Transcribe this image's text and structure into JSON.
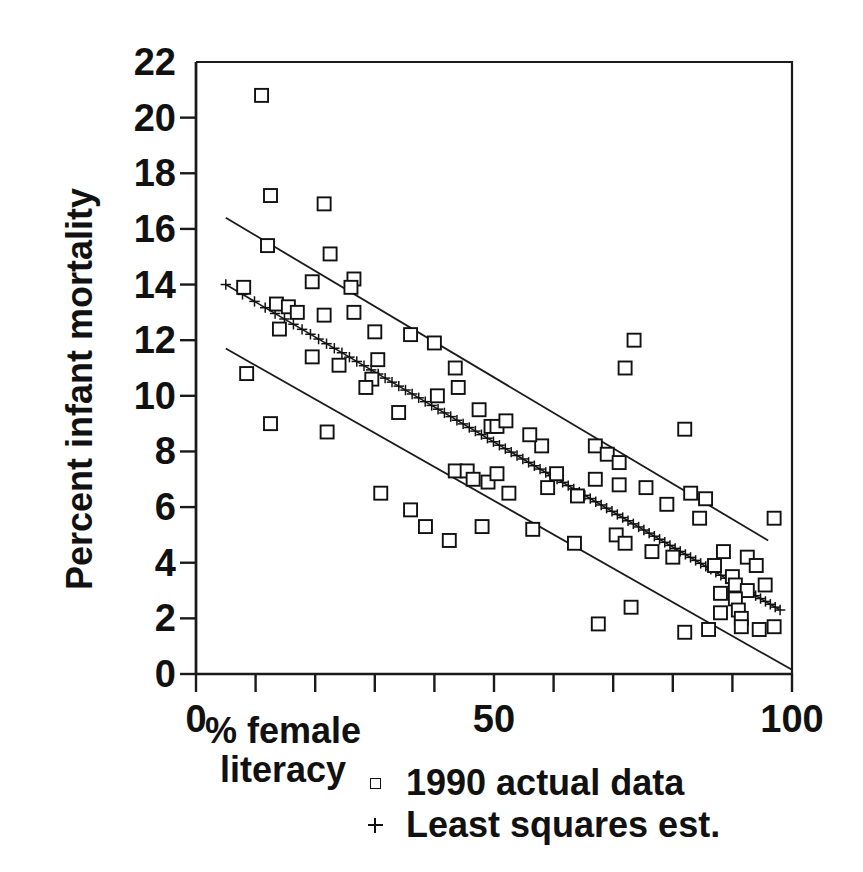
{
  "chart_data": {
    "type": "scatter",
    "title": "",
    "xlabel": "% female literacy",
    "ylabel": "Percent infant mortality",
    "xlim": [
      0,
      100
    ],
    "ylim": [
      0,
      22
    ],
    "xticks": [
      0,
      10,
      20,
      30,
      40,
      50,
      60,
      70,
      80,
      90,
      100
    ],
    "xtick_labels": [
      "0",
      "",
      "",
      "",
      "",
      "50",
      "",
      "",
      "",
      "",
      "100"
    ],
    "yticks": [
      0,
      2,
      4,
      6,
      8,
      10,
      12,
      14,
      16,
      18,
      20,
      22
    ],
    "ytick_labels": [
      "0",
      "2",
      "4",
      "6",
      "8",
      "10",
      "12",
      "14",
      "16",
      "18",
      "20",
      "22"
    ],
    "grid": false,
    "legend_position": "below-axes",
    "legend": [
      {
        "label": "1990 actual data",
        "marker": "square"
      },
      {
        "label": "Least squares est.",
        "marker": "plus"
      }
    ],
    "series": [
      {
        "name": "1990 actual data",
        "marker": "square",
        "points": [
          [
            11.0,
            20.8
          ],
          [
            12.5,
            17.2
          ],
          [
            21.5,
            16.9
          ],
          [
            12.0,
            15.4
          ],
          [
            22.5,
            15.1
          ],
          [
            26.5,
            14.2
          ],
          [
            26.0,
            13.9
          ],
          [
            8.0,
            13.9
          ],
          [
            19.5,
            14.1
          ],
          [
            13.5,
            13.3
          ],
          [
            15.5,
            13.2
          ],
          [
            17.0,
            13.0
          ],
          [
            14.0,
            12.4
          ],
          [
            21.5,
            12.9
          ],
          [
            26.5,
            13.0
          ],
          [
            30.0,
            12.3
          ],
          [
            36.0,
            12.2
          ],
          [
            40.0,
            11.9
          ],
          [
            19.5,
            11.4
          ],
          [
            24.0,
            11.1
          ],
          [
            30.5,
            11.3
          ],
          [
            29.5,
            10.6
          ],
          [
            43.5,
            11.0
          ],
          [
            44.0,
            10.3
          ],
          [
            8.5,
            10.8
          ],
          [
            12.5,
            9.0
          ],
          [
            22.0,
            8.7
          ],
          [
            28.5,
            10.3
          ],
          [
            34.0,
            9.4
          ],
          [
            40.5,
            10.0
          ],
          [
            47.5,
            9.5
          ],
          [
            49.5,
            8.9
          ],
          [
            50.5,
            8.9
          ],
          [
            52.0,
            9.1
          ],
          [
            58.0,
            8.2
          ],
          [
            56.0,
            8.6
          ],
          [
            67.0,
            8.2
          ],
          [
            69.0,
            7.9
          ],
          [
            71.0,
            7.6
          ],
          [
            73.5,
            12.0
          ],
          [
            72.0,
            11.0
          ],
          [
            82.0,
            8.8
          ],
          [
            31.0,
            6.5
          ],
          [
            36.0,
            5.9
          ],
          [
            43.5,
            7.3
          ],
          [
            45.5,
            7.3
          ],
          [
            46.5,
            7.0
          ],
          [
            49.0,
            6.9
          ],
          [
            50.5,
            7.2
          ],
          [
            52.5,
            6.5
          ],
          [
            60.5,
            7.2
          ],
          [
            59.0,
            6.7
          ],
          [
            64.0,
            6.4
          ],
          [
            67.0,
            7.0
          ],
          [
            71.0,
            6.8
          ],
          [
            75.5,
            6.7
          ],
          [
            79.0,
            6.1
          ],
          [
            83.0,
            6.5
          ],
          [
            85.5,
            6.3
          ],
          [
            84.5,
            5.6
          ],
          [
            97.0,
            5.6
          ],
          [
            38.5,
            5.3
          ],
          [
            42.5,
            4.8
          ],
          [
            48.0,
            5.3
          ],
          [
            56.5,
            5.2
          ],
          [
            63.5,
            4.7
          ],
          [
            70.5,
            5.0
          ],
          [
            72.0,
            4.7
          ],
          [
            76.5,
            4.4
          ],
          [
            80.0,
            4.2
          ],
          [
            88.5,
            4.4
          ],
          [
            87.0,
            3.9
          ],
          [
            90.0,
            3.5
          ],
          [
            92.5,
            4.2
          ],
          [
            94.0,
            3.9
          ],
          [
            90.5,
            3.2
          ],
          [
            92.5,
            3.0
          ],
          [
            95.5,
            3.2
          ],
          [
            67.5,
            1.8
          ],
          [
            73.0,
            2.4
          ],
          [
            82.0,
            1.5
          ],
          [
            88.0,
            2.9
          ],
          [
            90.5,
            2.7
          ],
          [
            91.0,
            2.3
          ],
          [
            91.5,
            2.0
          ],
          [
            91.5,
            1.7
          ],
          [
            94.5,
            1.6
          ],
          [
            97.0,
            1.7
          ],
          [
            86.0,
            1.6
          ],
          [
            88.0,
            2.2
          ]
        ]
      },
      {
        "name": "Least squares est.",
        "marker": "plus",
        "description": "Fitted regression line markers from x=5 to x=98",
        "fit_line": {
          "x0": 5,
          "y0": 14.0,
          "x1": 98,
          "y1": 2.3
        },
        "n_markers": 90
      }
    ],
    "bands": [
      {
        "name": "upper-confidence-band",
        "x0": 5,
        "y0": 16.4,
        "x1": 96,
        "y1": 4.8
      },
      {
        "name": "lower-confidence-band",
        "x0": 5,
        "y0": 11.7,
        "x1": 100,
        "y1": 0.15
      }
    ]
  },
  "axes": {
    "ylabel": "Percent infant mortality",
    "xlabel_line1": "% female",
    "xlabel_line2": "literacy"
  },
  "legend": {
    "items": [
      {
        "label": "1990 actual data"
      },
      {
        "label": "Least squares est."
      }
    ]
  }
}
